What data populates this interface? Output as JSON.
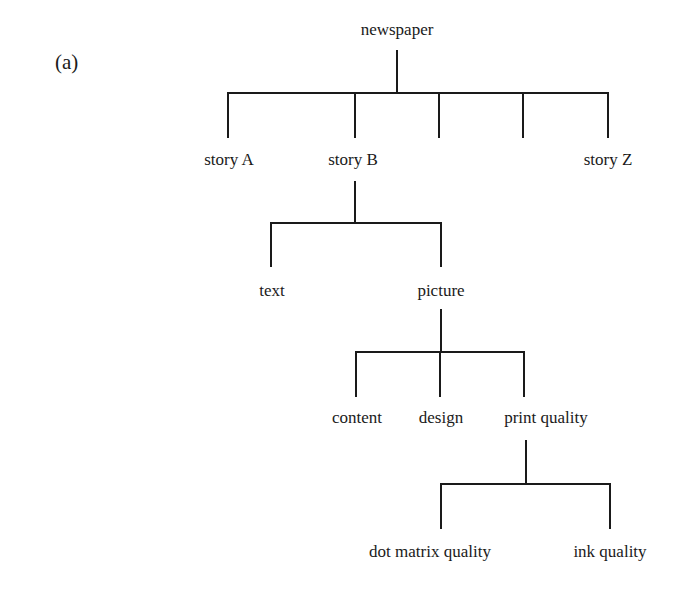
{
  "figure": {
    "label": "(a)"
  },
  "tree": {
    "root": "newspaper",
    "level1": [
      "story A",
      "story B",
      "",
      "",
      "story Z"
    ],
    "story_b_children": [
      "text",
      "picture"
    ],
    "picture_children": [
      "content",
      "design",
      "print quality"
    ],
    "print_quality_children": [
      "dot matrix quality",
      "ink quality"
    ]
  },
  "colors": {
    "line": "#1a1a1a",
    "text": "#1a1a1a",
    "background": "#ffffff"
  }
}
